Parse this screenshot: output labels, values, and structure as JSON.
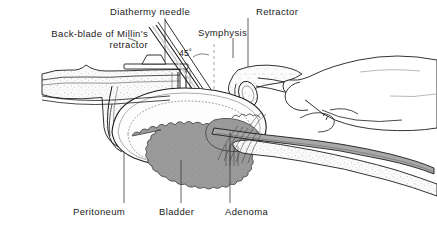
{
  "figure": {
    "background_color": "#ffffff",
    "line_color": "#1c1c1c",
    "adenoma_fill": "#9a9a9a",
    "tissue_fill": "#f2f2f2",
    "band_fill": "#a8a8a8",
    "label_color": "#1c1c1c"
  },
  "labels": {
    "back_blade_line1": "Back-blade of Millin's",
    "back_blade_line2": "retractor",
    "diathermy_needle": "Diathermy needle",
    "symphysis": "Symphysis",
    "retractor": "Retractor",
    "peritoneum": "Peritoneum",
    "bladder": "Bladder",
    "adenoma": "Adenoma",
    "angle": "45˚"
  },
  "annotations": {
    "angle_value": 45,
    "angle_unit": "degrees",
    "angle_reference": "vertical dashed line"
  },
  "structures": [
    {
      "name": "abdominal-wall",
      "style": "stippled-fill"
    },
    {
      "name": "millin-retractor-back-blade",
      "style": "outline"
    },
    {
      "name": "diathermy-needle",
      "style": "double-line-instrument"
    },
    {
      "name": "symphysis-pubis",
      "style": "stippled-bone"
    },
    {
      "name": "retractor-blade",
      "style": "outline"
    },
    {
      "name": "surgeons-hand",
      "style": "outline"
    },
    {
      "name": "bladder",
      "style": "outline-with-stipple"
    },
    {
      "name": "adenoma",
      "style": "gray-scalloped-mass"
    },
    {
      "name": "peritoneum",
      "style": "thin-double-line"
    },
    {
      "name": "prostatic-capsule-band",
      "style": "gray-band"
    }
  ]
}
